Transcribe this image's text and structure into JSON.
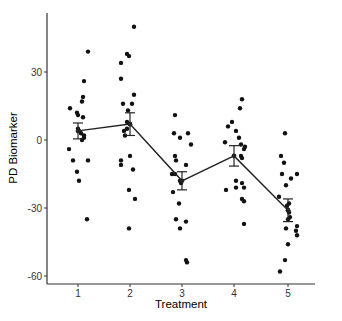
{
  "chart_data": {
    "type": "scatter",
    "title": "",
    "xlabel": "Treatment",
    "ylabel": "PD Biomarker",
    "categories": [
      "1",
      "2",
      "3",
      "4",
      "5"
    ],
    "ylim": [
      -63,
      55
    ],
    "yticks": [
      30,
      0,
      -30,
      -60
    ],
    "grid": false,
    "legend": null,
    "points": [
      {
        "group": "1",
        "values": [
          39,
          26,
          19,
          17,
          14,
          12,
          11,
          10,
          5,
          4,
          3,
          2,
          1,
          0,
          -4,
          -9,
          -9,
          -14,
          -18,
          -35
        ]
      },
      {
        "group": "2",
        "values": [
          50,
          38,
          37,
          34,
          27,
          20,
          16,
          16,
          13,
          8,
          7,
          5,
          4,
          2,
          -7,
          -9,
          -11,
          -13,
          -22,
          -26,
          -39
        ]
      },
      {
        "group": "3",
        "values": [
          11,
          3,
          1,
          3,
          -2,
          -7,
          -9,
          -11,
          -15,
          -15,
          -18,
          -19,
          -23,
          -28,
          -35,
          -36,
          -39,
          -53,
          -54
        ]
      },
      {
        "group": "4",
        "values": [
          18,
          14,
          8,
          6,
          4,
          1,
          -1,
          -2,
          -3,
          -4,
          -7,
          -8,
          -18,
          -19,
          -21,
          -22,
          -21,
          -26,
          -27,
          -37
        ]
      },
      {
        "group": "5",
        "values": [
          3,
          -7,
          -10,
          -15,
          -15,
          -17,
          -20,
          -25,
          -28,
          -29,
          -31,
          -32,
          -34,
          -35,
          -38,
          -40,
          -42,
          -39,
          -46,
          -53,
          -58
        ]
      }
    ],
    "jitter_px": {
      "1": [
        10,
        6,
        5,
        4,
        -8,
        -1,
        0,
        5,
        0,
        1,
        3,
        6,
        6,
        4,
        -9,
        -5,
        10,
        -1,
        1,
        9
      ],
      "2": [
        4,
        -3,
        -1,
        -9,
        -9,
        4,
        -7,
        2,
        -2,
        -3,
        0,
        -3,
        -6,
        -5,
        0,
        -9,
        -9,
        3,
        -1,
        5,
        -1
      ],
      "3": [
        -7,
        -8,
        -2,
        6,
        9,
        -7,
        -6,
        4,
        -10,
        -7,
        -2,
        -1,
        -9,
        -3,
        -6,
        4,
        -2,
        4,
        5
      ],
      "4": [
        8,
        6,
        -2,
        -6,
        2,
        5,
        -9,
        7,
        11,
        10,
        7,
        8,
        2,
        8,
        10,
        -8,
        2,
        8,
        10,
        10
      ],
      "5": [
        -3,
        -7,
        -4,
        -6,
        9,
        3,
        -2,
        -9,
        1,
        -1,
        0,
        1,
        2,
        0,
        9,
        8,
        9,
        -2,
        0,
        -3,
        -8
      ]
    },
    "means": [
      {
        "group": "1",
        "mean": 4,
        "se": 3.5
      },
      {
        "group": "2",
        "mean": 7,
        "se": 5
      },
      {
        "group": "3",
        "mean": -18,
        "se": 4
      },
      {
        "group": "4",
        "mean": -7,
        "se": 4.5
      },
      {
        "group": "5",
        "mean": -31,
        "se": 5
      }
    ]
  },
  "colors": {
    "points": "#111111",
    "line": "#222222",
    "axis": "#333333"
  }
}
